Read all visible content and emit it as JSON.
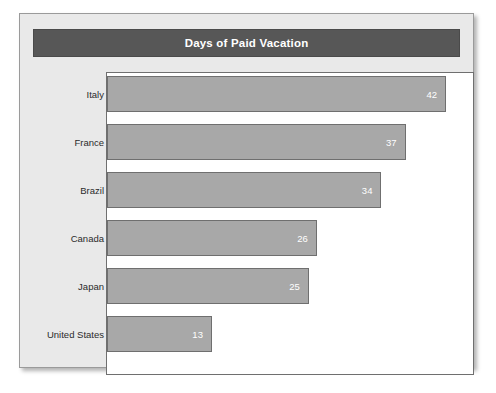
{
  "card": {
    "background_color": "#e9e9e9",
    "border_color": "#9a9a9a"
  },
  "title": {
    "text": "Days of Paid Vacation",
    "bar_color": "#575757",
    "text_color": "#ffffff"
  },
  "plot": {
    "background_color": "#ffffff",
    "border_color": "#6f6f6f",
    "bar_color": "#a8a8a8",
    "bar_border_color": "#6f6f6f",
    "value_label_color": "#ffffff",
    "category_label_color": "#2b2b2b"
  },
  "chart_data": {
    "type": "bar",
    "orientation": "horizontal",
    "title": "Days of Paid Vacation",
    "xlabel": "",
    "ylabel": "",
    "categories": [
      "Italy",
      "France",
      "Brazil",
      "Canada",
      "Japan",
      "United States"
    ],
    "values": [
      42,
      37,
      34,
      26,
      25,
      13
    ],
    "value_labels": [
      "42",
      "37",
      "34",
      "26",
      "25",
      "13"
    ],
    "xlim": [
      0,
      45.5
    ],
    "grid": false,
    "legend": false,
    "axis_ticks_visible": false
  }
}
